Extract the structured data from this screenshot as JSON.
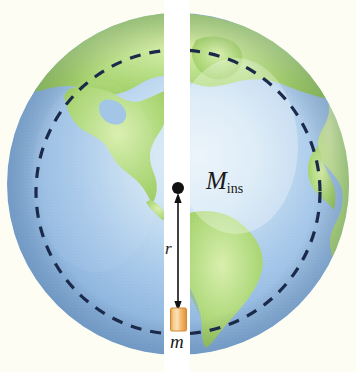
{
  "figure": {
    "type": "physics-diagram",
    "background_color": "#fdfdf4",
    "globe": {
      "center_x": 178,
      "center_y": 184,
      "radius": 171,
      "ocean_color": "#7fa9d6",
      "ocean_highlight_color": "#d7e8f5",
      "land_color": "#a6d368",
      "land_highlight_color": "#cbe79a"
    },
    "tunnel": {
      "name": "vertical tunnel",
      "color": "#ffffff",
      "x_left": 164,
      "x_right": 190
    },
    "dashed_circle": {
      "name": "radius-r sphere boundary",
      "color": "#1b2a4a",
      "center_x": 178,
      "center_y": 192,
      "radius": 142,
      "dash": "11 9",
      "stroke_width": 3
    },
    "center_dot": {
      "name": "earth-center-point",
      "x": 178,
      "y": 189,
      "radius": 6,
      "color": "#111111"
    },
    "arrow": {
      "name": "radius-arrow",
      "x": 178,
      "y_top": 192,
      "y_bottom": 310,
      "color": "#111111",
      "double_headed": true
    },
    "mass_block": {
      "name": "test-mass-block",
      "x": 171,
      "y": 308,
      "width": 16,
      "height": 23,
      "fill": "#f2a852",
      "highlight": "#fbd9a8",
      "stroke": "#c9822f"
    }
  },
  "labels": {
    "mass_inside": {
      "base": "M",
      "subscript": "ins",
      "full": "M_ins"
    },
    "radius": "r",
    "mass": "m"
  }
}
